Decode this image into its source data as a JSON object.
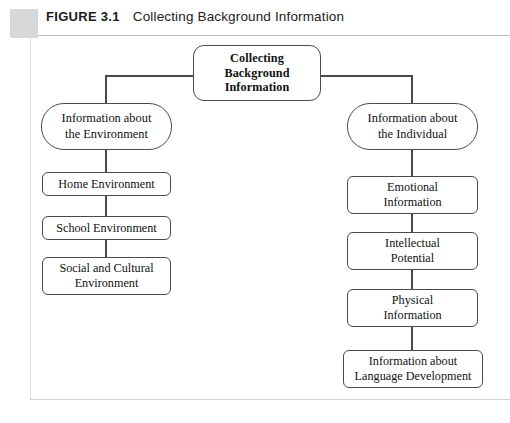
{
  "header": {
    "figure_label": "FIGURE 3.1",
    "caption": "Collecting Background Information",
    "tab_color": "#d7d8d9"
  },
  "diagram": {
    "type": "hierarchy-flowchart",
    "line_color": "#4a4a4a",
    "box_fill": "#ffffff",
    "root": {
      "id": "collecting-background-information",
      "label": "Collecting Background Information",
      "shape": "rounded-rectangle",
      "emphasis": "bold"
    },
    "branches": [
      {
        "id": "information-about-the-environment",
        "label": "Information about the Environment",
        "shape": "stadium",
        "side": "left",
        "children": [
          {
            "id": "home-environment",
            "label": "Home Environment",
            "shape": "rounded-rectangle"
          },
          {
            "id": "school-environment",
            "label": "School Environment",
            "shape": "rounded-rectangle"
          },
          {
            "id": "social-and-cultural-environment",
            "label": "Social and Cultural Environment",
            "shape": "rounded-rectangle"
          }
        ]
      },
      {
        "id": "information-about-the-individual",
        "label": "Information about the Individual",
        "shape": "stadium",
        "side": "right",
        "children": [
          {
            "id": "emotional-information",
            "label": "Emotional Information",
            "shape": "rounded-rectangle"
          },
          {
            "id": "intellectual-potential",
            "label": "Intellectual Potential",
            "shape": "rounded-rectangle"
          },
          {
            "id": "physical-information",
            "label": "Physical Information",
            "shape": "rounded-rectangle"
          },
          {
            "id": "information-about-language-development",
            "label": "Information about Language Development",
            "shape": "rounded-rectangle"
          }
        ]
      }
    ]
  },
  "nodes": {
    "root_line1": "Collecting",
    "root_line2": "Background",
    "root_line3": "Information",
    "env_line1": "Information about",
    "env_line2": "the Environment",
    "home": "Home Environment",
    "school": "School Environment",
    "social_line1": "Social and Cultural",
    "social_line2": "Environment",
    "indiv_line1": "Information about",
    "indiv_line2": "the Individual",
    "emotional_line1": "Emotional",
    "emotional_line2": "Information",
    "intellect_line1": "Intellectual",
    "intellect_line2": "Potential",
    "physical_line1": "Physical",
    "physical_line2": "Information",
    "language_line1": "Information about",
    "language_line2": "Language Development"
  }
}
